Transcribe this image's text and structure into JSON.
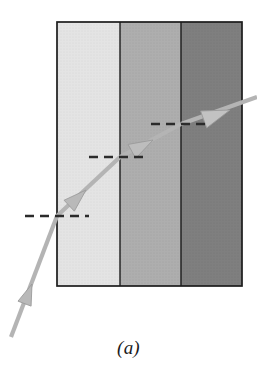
{
  "figure": {
    "caption": "(a)",
    "background_color": "#ffffff",
    "canvas": {
      "width": 257,
      "height": 377
    }
  },
  "slab": {
    "x": 57,
    "y": 22,
    "width": 185,
    "height": 264,
    "border_color": "#1c1c1c",
    "border_width": 1.6
  },
  "media": [
    {
      "name": "medium-1",
      "label": "light-gray-medium",
      "x": 57,
      "y": 22,
      "width": 63,
      "height": 264,
      "fill": "#e2e2e2"
    },
    {
      "name": "medium-2",
      "label": "mid-gray-medium",
      "x": 120,
      "y": 22,
      "width": 61,
      "height": 264,
      "fill": "#a9a9a9"
    },
    {
      "name": "medium-3",
      "label": "dark-gray-medium",
      "x": 181,
      "y": 22,
      "width": 61,
      "height": 264,
      "fill": "#787878"
    }
  ],
  "boundaries": [
    {
      "name": "boundary-1-2",
      "x": 120,
      "y1": 22,
      "y2": 286,
      "color": "#1c1c1c"
    },
    {
      "name": "boundary-2-3",
      "x": 181,
      "y1": 22,
      "y2": 286,
      "color": "#1c1c1c"
    }
  ],
  "ray": {
    "color": "#b4b4b4",
    "width": 4.2,
    "segments": [
      {
        "name": "incident-ray",
        "x1": 11,
        "y1": 337,
        "x2": 57,
        "y2": 216
      },
      {
        "name": "refracted-ray-medium-1",
        "x1": 57,
        "y1": 216,
        "x2": 120,
        "y2": 157
      },
      {
        "name": "refracted-ray-medium-2",
        "x1": 120,
        "y1": 157,
        "x2": 181,
        "y2": 124
      },
      {
        "name": "emergent-ray",
        "x1": 181,
        "y1": 124,
        "x2": 256,
        "y2": 97
      }
    ],
    "arrowheads": [
      {
        "name": "arrowhead-incident",
        "x": 32,
        "y": 284,
        "angle": -69.2
      },
      {
        "name": "arrowhead-medium-1",
        "x": 83,
        "y": 192,
        "angle": -43.1
      },
      {
        "name": "arrowhead-medium-2",
        "x": 151,
        "y": 141,
        "angle": -28.4
      },
      {
        "name": "arrowhead-emergent",
        "x": 225,
        "y": 112,
        "angle": -19.8
      }
    ]
  },
  "normals": [
    {
      "name": "normal-line-interface-1",
      "x1": 25,
      "x2": 89,
      "y": 216,
      "color": "#2b2b2b",
      "dash": "9 6",
      "width": 2.4
    },
    {
      "name": "normal-line-interface-2",
      "x1": 89,
      "x2": 149,
      "y": 157,
      "color": "#2b2b2b",
      "dash": "9 6",
      "width": 2.4
    },
    {
      "name": "normal-line-interface-3",
      "x1": 151,
      "x2": 211,
      "y": 124,
      "color": "#2b2b2b",
      "dash": "9 6",
      "width": 2.4
    }
  ]
}
